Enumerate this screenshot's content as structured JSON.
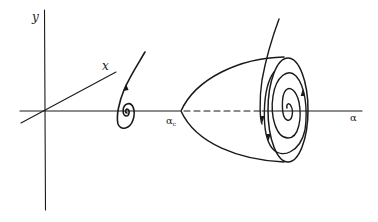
{
  "figure": {
    "axes": {
      "y_label": "y",
      "x_label": "x",
      "alpha_label": "α"
    },
    "critical_point": {
      "label": "α",
      "subscript": "c"
    },
    "elements": [
      {
        "name": "stable-focus-spiral",
        "position": "before critical point"
      },
      {
        "name": "limit-cycle-paraboloid",
        "position": "after critical point"
      },
      {
        "name": "unstable-equilibrium-dashed-line",
        "style": "dashed"
      }
    ],
    "colors": {
      "ink": "#1a1a1a",
      "background": "#ffffff"
    }
  }
}
